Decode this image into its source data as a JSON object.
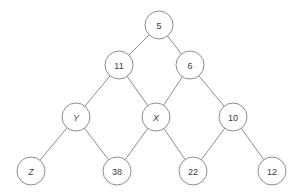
{
  "diagram": {
    "background_color": "#ffffff",
    "node_fill": "#ffffff",
    "node_stroke": "#8d8d8d",
    "edge_color": "#8d8d8d",
    "label_color": "#3b3b3b",
    "node_radius": 14,
    "nodes": [
      {
        "id": "n5",
        "label": "5",
        "x": 159,
        "y": 25,
        "italic": false,
        "level": 0
      },
      {
        "id": "n11",
        "label": "11",
        "x": 119,
        "y": 65,
        "italic": false,
        "level": 1
      },
      {
        "id": "n6",
        "label": "6",
        "x": 190,
        "y": 65,
        "italic": false,
        "level": 1
      },
      {
        "id": "nY",
        "label": "Y",
        "x": 76,
        "y": 117,
        "italic": true,
        "level": 2
      },
      {
        "id": "nX",
        "label": "X",
        "x": 156,
        "y": 117,
        "italic": true,
        "level": 2
      },
      {
        "id": "n10",
        "label": "10",
        "x": 233,
        "y": 117,
        "italic": false,
        "level": 2
      },
      {
        "id": "nZ",
        "label": "Z",
        "x": 31,
        "y": 171,
        "italic": true,
        "level": 3
      },
      {
        "id": "n38",
        "label": "38",
        "x": 117,
        "y": 171,
        "italic": false,
        "level": 3
      },
      {
        "id": "n22",
        "label": "22",
        "x": 193,
        "y": 171,
        "italic": false,
        "level": 3
      },
      {
        "id": "n12",
        "label": "12",
        "x": 272,
        "y": 171,
        "italic": false,
        "level": 3
      }
    ],
    "edges": [
      {
        "from": "n5",
        "to": "n11"
      },
      {
        "from": "n5",
        "to": "n6"
      },
      {
        "from": "n11",
        "to": "nY"
      },
      {
        "from": "n11",
        "to": "nX"
      },
      {
        "from": "n6",
        "to": "nX"
      },
      {
        "from": "n6",
        "to": "n10"
      },
      {
        "from": "nY",
        "to": "nZ"
      },
      {
        "from": "nY",
        "to": "n38"
      },
      {
        "from": "nX",
        "to": "n38"
      },
      {
        "from": "nX",
        "to": "n22"
      },
      {
        "from": "n10",
        "to": "n22"
      },
      {
        "from": "n10",
        "to": "n12"
      }
    ]
  }
}
